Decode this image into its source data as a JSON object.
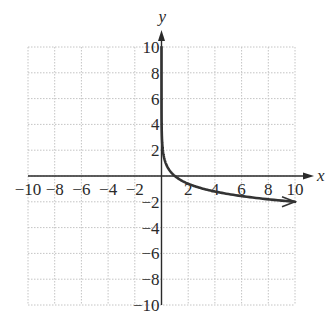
{
  "chart_data": {
    "type": "line",
    "title": "",
    "xlabel": "x",
    "ylabel": "y",
    "xlim": [
      -10,
      10
    ],
    "ylim": [
      -10,
      10
    ],
    "grid": true,
    "grid_step": 2,
    "x_ticks": [
      -10,
      -8,
      -6,
      -4,
      -2,
      2,
      4,
      6,
      8,
      10
    ],
    "y_ticks": [
      10,
      8,
      6,
      4,
      2,
      -2,
      -4,
      -6,
      -8,
      -10
    ],
    "x_tick_labels": [
      "−10",
      "−8",
      "−6",
      "−4",
      "−2",
      "2",
      "4",
      "6",
      "8",
      "10"
    ],
    "y_tick_labels": [
      "10",
      "8",
      "6",
      "4",
      "2",
      "−2",
      "−4",
      "−6",
      "−8",
      "−10"
    ],
    "series": [
      {
        "name": "y = -2 log x",
        "x": [
          1e-05,
          0.0001,
          0.001,
          0.01,
          0.1,
          0.5,
          1,
          2,
          4,
          6,
          8,
          10
        ],
        "y": [
          10,
          8,
          6,
          4,
          2,
          0.6,
          0,
          -0.6,
          -1.2,
          -1.56,
          -1.81,
          -2
        ],
        "color": "#333333",
        "end_arrow": true
      }
    ]
  },
  "axes": {
    "x_label": "x",
    "y_label": "y"
  }
}
